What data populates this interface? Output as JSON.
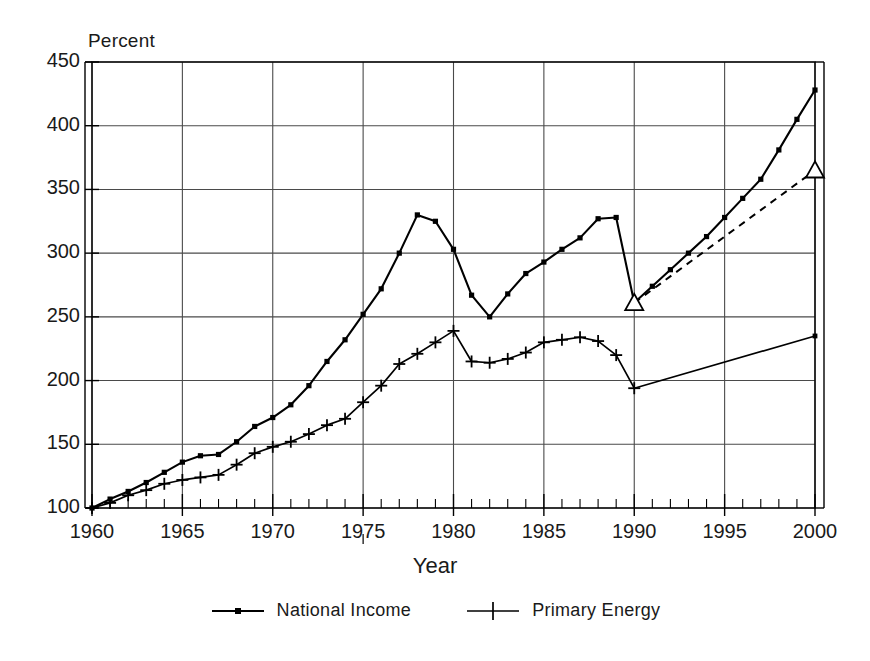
{
  "chart_data": {
    "type": "line",
    "title": "",
    "xlabel": "Year",
    "ylabel": "Percent",
    "ylabel_position": "top-left",
    "xlim": [
      1960,
      2000
    ],
    "ylim": [
      100,
      450
    ],
    "yticks": [
      100,
      150,
      200,
      250,
      300,
      350,
      400,
      450
    ],
    "xticks": [
      1960,
      1965,
      1970,
      1975,
      1980,
      1985,
      1990,
      1995,
      2000
    ],
    "xtick_minor_step": 1,
    "grid": true,
    "grid_style": "major-both",
    "legend_position": "bottom-center",
    "x": [
      1960,
      1961,
      1962,
      1963,
      1964,
      1965,
      1966,
      1967,
      1968,
      1969,
      1970,
      1971,
      1972,
      1973,
      1974,
      1975,
      1976,
      1977,
      1978,
      1979,
      1980,
      1981,
      1982,
      1983,
      1984,
      1985,
      1986,
      1987,
      1988,
      1989,
      1990,
      1991,
      1992,
      1993,
      1994,
      1995,
      1996,
      1997,
      1998,
      1999,
      2000
    ],
    "series": [
      {
        "name": "National Income",
        "marker": "square-dot",
        "linestyle": "solid",
        "color": "#000000",
        "values": [
          100,
          108,
          114,
          120,
          129,
          137,
          142,
          143,
          153,
          165,
          172,
          182,
          194,
          212,
          228,
          245,
          262,
          288,
          308,
          322,
          330,
          318,
          303,
          267,
          250,
          268,
          284,
          292,
          302,
          310,
          318,
          327,
          328,
          261,
          272,
          284,
          296,
          310,
          328,
          345,
          358
        ]
      },
      {
        "name": "Primary Energy",
        "marker": "plus",
        "linestyle": "solid",
        "color": "#000000",
        "values": [
          100,
          105,
          110,
          115,
          119,
          121,
          124,
          127,
          133,
          143,
          148,
          155,
          162,
          168,
          176,
          183,
          190,
          200,
          213,
          221,
          226,
          231,
          239,
          215,
          214,
          217,
          222,
          228,
          231,
          233,
          234,
          230,
          219,
          194,
          198,
          202,
          206,
          210,
          215,
          220,
          225
        ]
      }
    ],
    "series_notes": [
      "National Income is plotted on annual points 1960-1990 then 1990-2000.",
      "A structural break occurs at 1990: National Income drops from 328 (1989) to 261 (1990).",
      "Primary Energy drops from 234 (1989) to 194 (1990) and then rises linearly to 235 by 2000."
    ],
    "national_income_points": [
      {
        "year": 1960,
        "value": 100
      },
      {
        "year": 1961,
        "value": 106
      },
      {
        "year": 1962,
        "value": 111
      },
      {
        "year": 1963,
        "value": 115
      },
      {
        "year": 1964,
        "value": 123
      },
      {
        "year": 1965,
        "value": 130
      },
      {
        "year": 1966,
        "value": 134
      },
      {
        "year": 1967,
        "value": 134
      },
      {
        "year": 1968,
        "value": 144
      },
      {
        "year": 1969,
        "value": 155
      },
      {
        "year": 1970,
        "value": 163
      },
      {
        "year": 1971,
        "value": 168
      },
      {
        "year": 1972,
        "value": 176
      },
      {
        "year": 1973,
        "value": 185
      },
      {
        "year": 1974,
        "value": 188
      },
      {
        "year": 1975,
        "value": 186
      },
      {
        "year": 1976,
        "value": 199
      },
      {
        "year": 1977,
        "value": 206
      },
      {
        "year": 1978,
        "value": 214
      },
      {
        "year": 1979,
        "value": 223
      },
      {
        "year": 1980,
        "value": 225
      },
      {
        "year": 1981,
        "value": 224
      },
      {
        "year": 1982,
        "value": 221
      },
      {
        "year": 1983,
        "value": 225
      },
      {
        "year": 1984,
        "value": 232
      },
      {
        "year": 1985,
        "value": 237
      },
      {
        "year": 1986,
        "value": 243
      },
      {
        "year": 1987,
        "value": 247
      },
      {
        "year": 1988,
        "value": 256
      },
      {
        "year": 1989,
        "value": 265
      },
      {
        "year": 1990,
        "value": 261
      }
    ],
    "annotations": [
      {
        "label": "triangle-marker-1990",
        "year": 1990,
        "value": 261,
        "shape": "triangle"
      },
      {
        "label": "triangle-marker-2000",
        "year": 2000,
        "value": 365,
        "shape": "triangle"
      },
      {
        "label": "dashed-projection",
        "from_year": 1990,
        "from_value": 261,
        "to_year": 2000,
        "to_value": 365,
        "linestyle": "dashed"
      }
    ]
  },
  "axes": {
    "y_unit_label": "Percent",
    "x_title": "Year",
    "ytick_labels": [
      "450",
      "400",
      "350",
      "300",
      "250",
      "200",
      "150",
      "100"
    ],
    "xtick_labels": [
      "1960",
      "1965",
      "1970",
      "1975",
      "1980",
      "1985",
      "1990",
      "1995",
      "2000"
    ]
  },
  "legend": {
    "entries": [
      {
        "label": "National Income",
        "marker": "square-dot"
      },
      {
        "label": "Primary Energy",
        "marker": "plus"
      }
    ]
  },
  "colors": {
    "ink": "#000000",
    "grid": "#4a4a4a",
    "background": "#ffffff"
  }
}
